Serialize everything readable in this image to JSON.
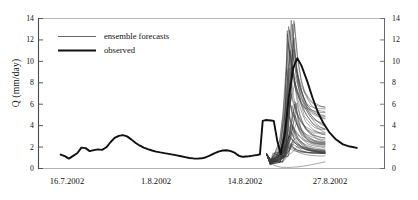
{
  "figure": {
    "title": "",
    "y_axis_title": "Q (mm/day)"
  },
  "legend": {
    "items": [
      {
        "label": "ensemble forecasts",
        "style": "thin-line",
        "color": "#444444"
      },
      {
        "label": "observed",
        "style": "thick-line",
        "color": "#111111"
      }
    ]
  },
  "axes": {
    "y_ticks": [
      "0",
      "2",
      "4",
      "6",
      "8",
      "10",
      "12",
      "14"
    ],
    "y_ticks_right": [
      "0",
      "2",
      "4",
      "6",
      "8",
      "10",
      "12",
      "14"
    ],
    "x_ticks": [
      "16.7.2002",
      "1.8.2002",
      "14.8.2002",
      "27.8.2002"
    ]
  },
  "chart_data": {
    "type": "line",
    "title": "",
    "xlabel": "",
    "ylabel": "Q (mm/day)",
    "ylim": [
      0,
      14
    ],
    "yticks": [
      0,
      2,
      4,
      6,
      8,
      10,
      12,
      14
    ],
    "xlim": [
      "12.7.2002",
      "31.8.2002"
    ],
    "xtick_labels": [
      "16.7.2002",
      "1.8.2002",
      "14.8.2002",
      "27.8.2002"
    ],
    "xtick_positions_days": [
      4,
      20,
      33,
      46
    ],
    "grid": false,
    "legend_position": "upper-left",
    "series": [
      {
        "name": "observed",
        "color": "#111111",
        "linewidth": 1.9,
        "x_days": [
          3.2,
          3.8,
          4.4,
          5.0,
          5.6,
          6.2,
          6.8,
          7.4,
          8.0,
          8.6,
          9.2,
          9.8,
          10.4,
          11.0,
          11.6,
          12.2,
          12.8,
          13.4,
          14.0,
          14.6,
          15.2,
          15.8,
          16.4,
          17.0,
          17.6,
          18.2,
          18.8,
          19.4,
          20.0,
          20.6,
          21.2,
          21.8,
          22.4,
          23.0,
          23.6,
          24.2,
          24.8,
          25.4,
          26.0,
          26.6,
          27.2,
          27.8,
          28.4,
          28.7,
          29.0,
          29.3,
          29.6,
          30.0,
          30.4,
          30.8,
          31.2,
          31.6,
          32.0,
          32.4,
          32.8,
          33.2,
          33.6,
          34.0,
          34.5,
          35.0,
          35.6,
          36.2,
          36.8,
          37.4,
          38.0,
          38.8,
          39.6,
          40.4,
          41.2,
          42.0,
          43.0,
          44.0,
          45.0,
          46.0
        ],
        "y": [
          1.3,
          1.15,
          0.92,
          1.18,
          1.42,
          1.95,
          1.9,
          1.62,
          1.72,
          1.78,
          1.74,
          1.98,
          2.45,
          2.85,
          3.05,
          3.12,
          3.0,
          2.72,
          2.4,
          2.15,
          1.95,
          1.8,
          1.68,
          1.58,
          1.5,
          1.43,
          1.37,
          1.3,
          1.22,
          1.14,
          1.06,
          0.98,
          0.94,
          0.92,
          0.95,
          1.05,
          1.22,
          1.42,
          1.58,
          1.68,
          1.7,
          1.62,
          1.45,
          1.3,
          1.18,
          1.12,
          1.1,
          1.12,
          1.14,
          1.18,
          1.22,
          1.26,
          1.32,
          4.45,
          4.52,
          4.5,
          4.48,
          4.45,
          2.6,
          1.35,
          3.2,
          6.8,
          9.4,
          10.3,
          9.6,
          8.2,
          6.6,
          5.2,
          4.2,
          3.4,
          2.7,
          2.25,
          2.05,
          1.92
        ]
      }
    ],
    "ensemble": {
      "name": "ensemble forecasts",
      "color": "#3a3a3a",
      "linewidth": 0.45,
      "n_members": 50,
      "start_day": 33.0,
      "end_day": 41.4,
      "peak_day_range": [
        35.8,
        37.4
      ],
      "peak_value_range": [
        2.0,
        13.8
      ],
      "end_value_range": [
        0.5,
        4.6
      ],
      "description": "Spaghetti plot: 50 ensemble members diverging from a common initial state near day 33, peaking between days 36 and 37, then receding."
    }
  }
}
